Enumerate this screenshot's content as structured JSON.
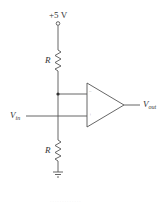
{
  "diagram": {
    "type": "op-amp comparator circuit",
    "supply": {
      "label": "+5 V"
    },
    "resistor_top": {
      "label": "R"
    },
    "resistor_bottom": {
      "label": "R"
    },
    "input": {
      "symbol": "V",
      "subscript": "in"
    },
    "output": {
      "symbol": "V",
      "subscript": "out"
    },
    "opamp": {
      "inverting_sign": "−",
      "noninverting_sign": "+"
    },
    "ground": {
      "name": "ground"
    },
    "footer_faint_text": "· · · ·  · · · · · · · · ·"
  },
  "colors": {
    "wire": "#555555",
    "background": "#ffffff",
    "text": "#333333"
  }
}
